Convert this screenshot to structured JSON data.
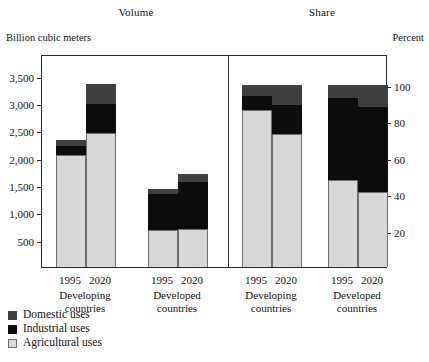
{
  "panels": {
    "volume_title": "Volume",
    "share_title": "Share",
    "left_unit": "Billion cubic meters",
    "right_unit": "Percent"
  },
  "axes": {
    "left_ticks": [
      "3,500",
      "3,000",
      "2,500",
      "2,000",
      "1,500",
      "1,000",
      "500"
    ],
    "left_tick_values": [
      3500,
      3000,
      2500,
      2000,
      1500,
      1000,
      500
    ],
    "right_ticks": [
      "100",
      "80",
      "60",
      "40",
      "20"
    ],
    "right_tick_values": [
      100,
      80,
      60,
      40,
      20
    ],
    "left_max": 3900,
    "right_max": 117
  },
  "groups": [
    {
      "id": "volume-developing",
      "label_line1": "Developing",
      "label_line2": "countries",
      "years": [
        "1995",
        "2020"
      ]
    },
    {
      "id": "volume-developed",
      "label_line1": "Developed",
      "label_line2": "countries",
      "years": [
        "1995",
        "2020"
      ]
    },
    {
      "id": "share-developing",
      "label_line1": "Developing",
      "label_line2": "countries",
      "years": [
        "1995",
        "2020"
      ]
    },
    {
      "id": "share-developed",
      "label_line1": "Developed",
      "label_line2": "countries",
      "years": [
        "1995",
        "2020"
      ]
    }
  ],
  "legend": {
    "items": [
      {
        "key": "domestic",
        "label": "Domestic uses",
        "color": "#3f3f3f"
      },
      {
        "key": "industrial",
        "label": "Industrial uses",
        "color": "#0d0d0d"
      },
      {
        "key": "agricultural",
        "label": "Agricultural uses",
        "color": "#dcdcdc"
      }
    ]
  },
  "chart_data": {
    "type": "bar",
    "subtype": "stacked",
    "panels": [
      {
        "name": "Volume",
        "ylabel": "Billion cubic meters",
        "ylim": [
          0,
          3900
        ],
        "yticks": [
          500,
          1000,
          1500,
          2000,
          2500,
          3000,
          3500
        ],
        "categories": [
          "Developing countries 1995",
          "Developing countries 2020",
          "Developed countries 1995",
          "Developed countries 2020"
        ],
        "series": [
          {
            "name": "Agricultural uses",
            "values": [
              2050,
              2450,
              680,
              690
            ]
          },
          {
            "name": "Industrial uses",
            "values": [
              170,
              530,
              650,
              870
            ]
          },
          {
            "name": "Domestic uses",
            "values": [
              110,
              370,
              90,
              140
            ]
          }
        ],
        "totals": [
          2330,
          3350,
          1420,
          1700
        ]
      },
      {
        "name": "Share",
        "ylabel": "Percent",
        "ylim": [
          0,
          117
        ],
        "yticks": [
          20,
          40,
          60,
          80,
          100
        ],
        "categories": [
          "Developing countries 1995",
          "Developing countries 2020",
          "Developed countries 1995",
          "Developed countries 2020"
        ],
        "series": [
          {
            "name": "Agricultural uses",
            "values": [
              86,
              73,
              48,
              41
            ]
          },
          {
            "name": "Industrial uses",
            "values": [
              8,
              16,
              45,
              47
            ]
          },
          {
            "name": "Domestic uses",
            "values": [
              6,
              11,
              7,
              12
            ]
          }
        ],
        "totals": [
          100,
          100,
          100,
          100
        ]
      }
    ],
    "legend_position": "bottom-left",
    "grid": false
  }
}
